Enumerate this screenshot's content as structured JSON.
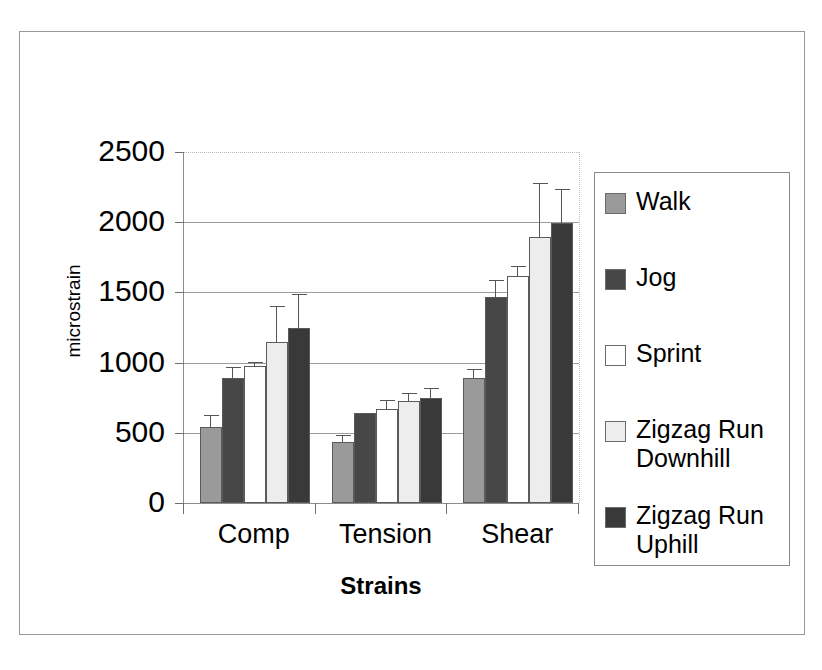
{
  "chart_data": {
    "type": "bar",
    "title": "",
    "xlabel": "Strains",
    "ylabel": "microstrain",
    "categories": [
      "Comp",
      "Tension",
      "Shear"
    ],
    "ylim": [
      0,
      2500
    ],
    "yticks": [
      0,
      500,
      1000,
      1500,
      2000,
      2500
    ],
    "ytick_labels": [
      "0",
      "500",
      "1000",
      "1500",
      "2000",
      "2500"
    ],
    "grid": true,
    "legend_position": "right",
    "series": [
      {
        "name": "Walk",
        "color": "#9a9a9a",
        "values": [
          540,
          435,
          890
        ],
        "errors": [
          80,
          40,
          60
        ]
      },
      {
        "name": "Jog",
        "color": "#474747",
        "values": [
          890,
          640,
          1470
        ],
        "errors": [
          70,
          0,
          110
        ]
      },
      {
        "name": "Sprint",
        "color": "#ffffff",
        "values": [
          975,
          670,
          1620
        ],
        "errors": [
          25,
          60,
          60
        ]
      },
      {
        "name": "Zigzag Run Downhill",
        "color": "#ededed",
        "values": [
          1150,
          725,
          1895
        ],
        "errors": [
          245,
          55,
          375
        ]
      },
      {
        "name": "Zigzag Run Uphill",
        "color": "#393939",
        "values": [
          1250,
          750,
          1995
        ],
        "errors": [
          235,
          65,
          235
        ]
      }
    ]
  },
  "legend": {
    "items": [
      {
        "label": "Walk",
        "swatch_class": "swatch-walk",
        "icon": "legend-swatch-walk"
      },
      {
        "label": "Jog",
        "swatch_class": "swatch-jog",
        "icon": "legend-swatch-jog"
      },
      {
        "label": "Sprint",
        "swatch_class": "swatch-sprint",
        "icon": "legend-swatch-sprint"
      },
      {
        "label": "Zigzag Run\nDownhill",
        "swatch_class": "swatch-zdown",
        "icon": "legend-swatch-zigzag-downhill"
      },
      {
        "label": "Zigzag Run\nUphill",
        "swatch_class": "swatch-zup",
        "icon": "legend-swatch-zigzag-uphill"
      }
    ]
  },
  "axes": {
    "y_title": "microstrain",
    "x_title": "Strains",
    "y_tick_labels": [
      "2500",
      "2000",
      "1500",
      "1000",
      "500",
      "0"
    ],
    "x_category_labels": [
      "Comp",
      "Tension",
      "Shear"
    ]
  }
}
